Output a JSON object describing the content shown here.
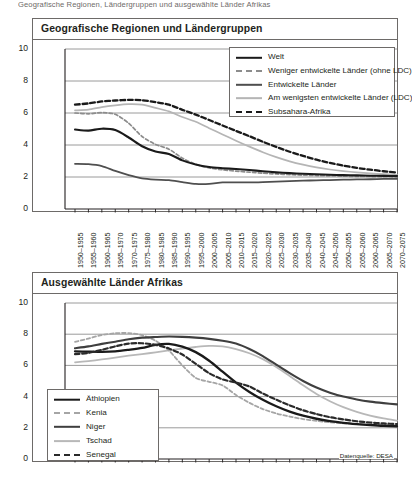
{
  "caption": "Geografische Regionen, Ländergruppen und ausgewählte Länder Afrikas",
  "source_note": "Datenquelle: DESA",
  "colors": {
    "black": "#1a1a1a",
    "dark_gray": "#4f4f4f",
    "mid_gray": "#8c8c8c",
    "light_gray": "#b5b5b5",
    "panel_border": "#6d6a68",
    "grid": "#8e8e8e",
    "background": "#ffffff"
  },
  "x_categories": [
    "1950–1955",
    "1955–1960",
    "1960–1965",
    "1965–1970",
    "1970–1975",
    "1975–1980",
    "1980–1985",
    "1985–1990",
    "1990–1995",
    "1995–2000",
    "2000–2005",
    "2005–2010",
    "2010–2015",
    "2015–2020",
    "2020–2025",
    "2025–2030",
    "2030–2035",
    "2035–2040",
    "2040–2045",
    "2045–2050",
    "2050–2055",
    "2055–2060",
    "2060–2065",
    "2065–2070",
    "2070–2075"
  ],
  "y_ticks": [
    "0",
    "2",
    "4",
    "6",
    "8",
    "10"
  ],
  "chart_data": [
    {
      "type": "line",
      "title": "Geografische Regionen und Ländergruppen",
      "xlabel": "",
      "ylabel": "",
      "ylim": [
        0,
        10
      ],
      "grid": true,
      "legend_position": "top-right",
      "categories": [
        "1950–1955",
        "1955–1960",
        "1960–1965",
        "1965–1970",
        "1970–1975",
        "1975–1980",
        "1980–1985",
        "1985–1990",
        "1990–1995",
        "1995–2000",
        "2000–2005",
        "2005–2010",
        "2010–2015",
        "2015–2020",
        "2020–2025",
        "2025–2030",
        "2030–2035",
        "2035–2040",
        "2040–2045",
        "2045–2050",
        "2050–2055",
        "2055–2060",
        "2060–2065",
        "2065–2070",
        "2070–2075"
      ],
      "series": [
        {
          "name": "Welt",
          "style": "solid",
          "color": "#1a1a1a",
          "width": 2.1,
          "values": [
            4.97,
            4.9,
            5.02,
            4.93,
            4.47,
            3.92,
            3.59,
            3.44,
            3.04,
            2.78,
            2.62,
            2.55,
            2.5,
            2.44,
            2.36,
            2.29,
            2.24,
            2.2,
            2.17,
            2.14,
            2.12,
            2.1,
            2.08,
            2.07,
            2.06
          ]
        },
        {
          "name": "Weniger entwickelte Länder (ohne LDC)",
          "style": "dashed",
          "color": "#8c8c8c",
          "width": 1.7,
          "values": [
            6.0,
            5.95,
            6.02,
            5.92,
            5.36,
            4.53,
            4.04,
            3.74,
            3.18,
            2.79,
            2.57,
            2.45,
            2.37,
            2.3,
            2.24,
            2.19,
            2.15,
            2.12,
            2.09,
            2.07,
            2.05,
            2.04,
            2.03,
            2.02,
            2.01
          ]
        },
        {
          "name": "Entwickelte Länder",
          "style": "solid",
          "color": "#4f4f4f",
          "width": 1.8,
          "values": [
            2.82,
            2.8,
            2.68,
            2.38,
            2.12,
            1.92,
            1.84,
            1.8,
            1.68,
            1.57,
            1.57,
            1.66,
            1.67,
            1.66,
            1.68,
            1.71,
            1.74,
            1.77,
            1.79,
            1.81,
            1.83,
            1.85,
            1.86,
            1.88,
            1.89
          ]
        },
        {
          "name": "Am wenigsten entwickelte Länder (LDC)",
          "style": "solid",
          "color": "#b5b5b5",
          "width": 1.7,
          "values": [
            6.16,
            6.21,
            6.37,
            6.48,
            6.55,
            6.52,
            6.32,
            6.1,
            5.75,
            5.45,
            5.05,
            4.66,
            4.27,
            3.9,
            3.55,
            3.24,
            2.98,
            2.77,
            2.6,
            2.47,
            2.37,
            2.29,
            2.23,
            2.18,
            2.14
          ]
        },
        {
          "name": "Subsahara-Afrika",
          "style": "dashed-bold",
          "color": "#1a1a1a",
          "width": 2.3,
          "values": [
            6.52,
            6.6,
            6.72,
            6.78,
            6.82,
            6.8,
            6.68,
            6.52,
            6.2,
            5.9,
            5.56,
            5.22,
            4.88,
            4.55,
            4.2,
            3.88,
            3.58,
            3.32,
            3.08,
            2.88,
            2.71,
            2.57,
            2.46,
            2.36,
            2.28
          ]
        }
      ]
    },
    {
      "type": "line",
      "title": "Ausgewählte Länder Afrikas",
      "xlabel": "",
      "ylabel": "",
      "ylim": [
        0,
        10
      ],
      "grid": true,
      "legend_position": "bottom-left",
      "categories": [
        "1950–1955",
        "1955–1960",
        "1960–1965",
        "1965–1970",
        "1970–1975",
        "1975–1980",
        "1980–1985",
        "1985–1990",
        "1990–1995",
        "1995–2000",
        "2000–2005",
        "2005–2010",
        "2010–2015",
        "2015–2020",
        "2020–2025",
        "2025–2030",
        "2030–2035",
        "2035–2040",
        "2040–2045",
        "2045–2050",
        "2050–2055",
        "2055–2060",
        "2060–2065",
        "2065–2070",
        "2070–2075"
      ],
      "series": [
        {
          "name": "Äthiopien",
          "style": "solid",
          "color": "#1a1a1a",
          "width": 2.3,
          "values": [
            6.9,
            6.88,
            6.87,
            6.9,
            7.0,
            7.12,
            7.32,
            7.38,
            7.2,
            6.85,
            6.3,
            5.6,
            4.9,
            4.3,
            3.8,
            3.38,
            3.04,
            2.78,
            2.58,
            2.43,
            2.32,
            2.24,
            2.18,
            2.13,
            2.1
          ]
        },
        {
          "name": "Kenia",
          "style": "dashed",
          "color": "#a5a5a5",
          "width": 1.8,
          "values": [
            7.51,
            7.72,
            7.95,
            8.06,
            8.07,
            7.94,
            7.58,
            6.95,
            6.0,
            5.2,
            4.95,
            4.72,
            4.1,
            3.6,
            3.2,
            2.92,
            2.72,
            2.56,
            2.44,
            2.35,
            2.29,
            2.24,
            2.2,
            2.17,
            2.15
          ]
        },
        {
          "name": "Niger",
          "style": "solid",
          "color": "#3f3f3f",
          "width": 2.1,
          "values": [
            7.1,
            7.22,
            7.38,
            7.52,
            7.68,
            7.78,
            7.82,
            7.85,
            7.83,
            7.78,
            7.7,
            7.58,
            7.4,
            7.05,
            6.6,
            6.05,
            5.5,
            5.0,
            4.58,
            4.25,
            4.0,
            3.82,
            3.68,
            3.58,
            3.5
          ]
        },
        {
          "name": "Tschad",
          "style": "solid",
          "color": "#b8b8b8",
          "width": 1.8,
          "values": [
            6.2,
            6.28,
            6.38,
            6.5,
            6.62,
            6.72,
            6.84,
            6.96,
            7.08,
            7.18,
            7.25,
            7.22,
            7.05,
            6.78,
            6.4,
            5.9,
            5.32,
            4.72,
            4.16,
            3.7,
            3.32,
            3.02,
            2.78,
            2.6,
            2.46
          ]
        },
        {
          "name": "Senegal",
          "style": "dashed-bold",
          "color": "#2a2a2a",
          "width": 2.2,
          "values": [
            6.72,
            6.8,
            7.0,
            7.22,
            7.4,
            7.42,
            7.32,
            7.08,
            6.7,
            6.1,
            5.5,
            5.1,
            4.9,
            4.65,
            4.2,
            3.8,
            3.44,
            3.12,
            2.88,
            2.68,
            2.54,
            2.42,
            2.34,
            2.28,
            2.24
          ]
        }
      ]
    }
  ],
  "legend1": {
    "items": [
      {
        "label": "Welt",
        "style": "solid",
        "color": "#1a1a1a",
        "width": 2.4
      },
      {
        "label": "Weniger entwickelte Länder (ohne LDC)",
        "style": "dashed",
        "color": "#8c8c8c",
        "width": 2.0
      },
      {
        "label": "Entwickelte Länder",
        "style": "solid",
        "color": "#4f4f4f",
        "width": 2.4
      },
      {
        "label": "Am wenigsten entwickelte Länder (LDC)",
        "style": "solid",
        "color": "#b5b5b5",
        "width": 1.7
      },
      {
        "label": "Subsahara-Afrika",
        "style": "dashed",
        "color": "#1a1a1a",
        "width": 2.6
      }
    ]
  },
  "legend2": {
    "items": [
      {
        "label": "Äthiopien",
        "style": "solid",
        "color": "#1a1a1a",
        "width": 2.6
      },
      {
        "label": "Kenia",
        "style": "dashed",
        "color": "#a5a5a5",
        "width": 2.0
      },
      {
        "label": "Niger",
        "style": "solid",
        "color": "#3f3f3f",
        "width": 2.4
      },
      {
        "label": "Tschad",
        "style": "solid",
        "color": "#b8b8b8",
        "width": 1.8
      },
      {
        "label": "Senegal",
        "style": "dashed",
        "color": "#2a2a2a",
        "width": 2.6
      }
    ]
  }
}
